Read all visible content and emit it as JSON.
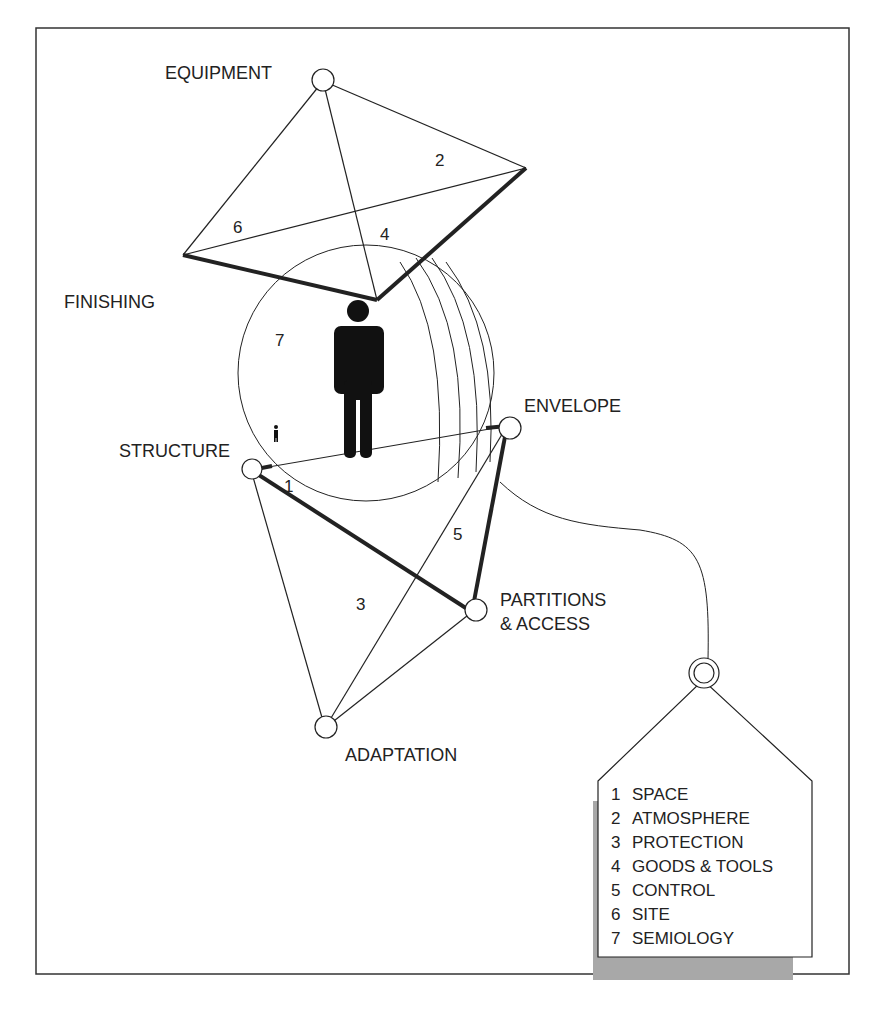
{
  "diagram": {
    "nodes": {
      "equipment": "EQUIPMENT",
      "finishing": "FINISHING",
      "envelope": "ENVELOPE",
      "structure": "STRUCTURE",
      "partitions_line1": "PARTITIONS",
      "partitions_line2": "& ACCESS",
      "adaptation": "ADAPTATION"
    },
    "face_numbers": {
      "n1": "1",
      "n2": "2",
      "n3": "3",
      "n4": "4",
      "n5": "5",
      "n6": "6",
      "n7": "7"
    },
    "legend": {
      "items": [
        {
          "num": "1",
          "label": "SPACE"
        },
        {
          "num": "2",
          "label": "ATMOSPHERE"
        },
        {
          "num": "3",
          "label": "PROTECTION"
        },
        {
          "num": "4",
          "label": "GOODS & TOOLS"
        },
        {
          "num": "5",
          "label": "CONTROL"
        },
        {
          "num": "6",
          "label": "SITE"
        },
        {
          "num": "7",
          "label": "SEMIOLOGY"
        }
      ]
    }
  }
}
